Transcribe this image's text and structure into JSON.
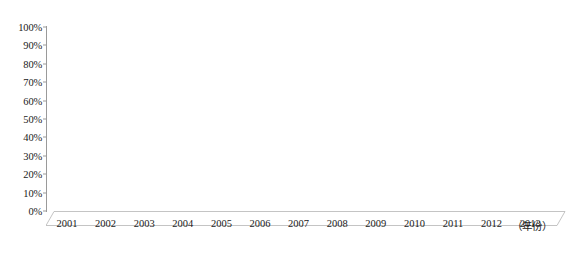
{
  "chart_data": {
    "type": "bar",
    "title": "",
    "subtitle": "",
    "xlabel": "（年份）",
    "ylabel": "",
    "categories": [
      "2001",
      "2002",
      "2003",
      "2004",
      "2005",
      "2006",
      "2007",
      "2008",
      "2009",
      "2010",
      "2011",
      "2012",
      "2013"
    ],
    "values": [
      36,
      32,
      29,
      32,
      32,
      30,
      28,
      28,
      29,
      26,
      29,
      31,
      31
    ],
    "series": [
      {
        "name": "占比",
        "values": [
          36,
          32,
          29,
          32,
          32,
          30,
          28,
          28,
          29,
          26,
          29,
          31,
          31
        ]
      }
    ],
    "ylim": [
      0,
      100
    ],
    "y_ticks": [
      0,
      10,
      20,
      30,
      40,
      50,
      60,
      70,
      80,
      90,
      100
    ],
    "y_tick_labels": [
      "0%",
      "10%",
      "20%",
      "30%",
      "40%",
      "50%",
      "60%",
      "70%",
      "80%",
      "90%",
      "100%"
    ],
    "grid": false,
    "legend": "none",
    "style": "3d-column-100-percent-shell",
    "colors": {
      "fill_front": "#595959",
      "fill_side": "#2b2b2b",
      "fill_top": "#3d3d3d",
      "shell_front": "#fafafa",
      "shell_side": "#bdbdbd",
      "axis": "#9a9a9a",
      "text": "#1a1a1a"
    }
  }
}
